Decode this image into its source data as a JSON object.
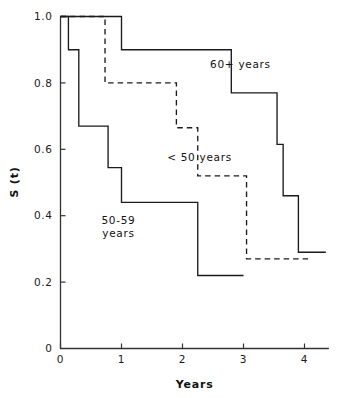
{
  "chart_data": {
    "type": "line",
    "subtype": "kaplan-meier-step",
    "title": "",
    "xlabel": "Years",
    "ylabel": "S (t)",
    "xlim": [
      0,
      4.4
    ],
    "ylim": [
      0,
      1.0
    ],
    "xticks": [
      0,
      1,
      2,
      3,
      4
    ],
    "xtick_labels": [
      "0",
      "1",
      "2",
      "3",
      "4"
    ],
    "yticks": [
      0,
      0.2,
      0.4,
      0.6,
      0.8,
      1.0
    ],
    "ytick_labels": [
      "0",
      "0.2",
      "0.4",
      "0.6",
      "0.8",
      "1.0"
    ],
    "grid": false,
    "legend": "inline-annotations",
    "series": [
      {
        "name": "60+ years",
        "style": "solid",
        "label_x": 2.95,
        "label_y": 0.845,
        "x": [
          0.0,
          1.0,
          1.0,
          2.8,
          2.8,
          3.55,
          3.55,
          3.65,
          3.65,
          3.9,
          3.9,
          4.35
        ],
        "y": [
          1.0,
          1.0,
          0.9,
          0.9,
          0.77,
          0.77,
          0.615,
          0.615,
          0.46,
          0.46,
          0.29,
          0.29
        ],
        "steps": [
          {
            "t": 0.0,
            "s": 1.0
          },
          {
            "t": 1.0,
            "s": 0.9
          },
          {
            "t": 2.8,
            "s": 0.77
          },
          {
            "t": 3.55,
            "s": 0.615
          },
          {
            "t": 3.65,
            "s": 0.46
          },
          {
            "t": 3.9,
            "s": 0.29
          }
        ],
        "end_time": 4.35
      },
      {
        "name": "< 50 years",
        "style": "dashed",
        "label_x": 2.28,
        "label_y": 0.565,
        "x": [
          0.0,
          0.73,
          0.73,
          1.9,
          1.9,
          2.25,
          2.25,
          3.05,
          3.05,
          4.1
        ],
        "y": [
          1.0,
          1.0,
          0.8,
          0.8,
          0.665,
          0.665,
          0.52,
          0.52,
          0.27,
          0.27
        ],
        "steps": [
          {
            "t": 0.0,
            "s": 1.0
          },
          {
            "t": 0.73,
            "s": 0.8
          },
          {
            "t": 1.9,
            "s": 0.665
          },
          {
            "t": 2.25,
            "s": 0.52
          },
          {
            "t": 3.05,
            "s": 0.27
          }
        ],
        "end_time": 4.1
      },
      {
        "name": "50-59\nyears",
        "label_line1": "50-59",
        "label_line2": "years",
        "style": "solid",
        "label_x": 0.95,
        "label_y": 0.375,
        "x": [
          0.0,
          0.13,
          0.13,
          0.3,
          0.3,
          0.78,
          0.78,
          1.0,
          1.0,
          2.25,
          2.25,
          3.0
        ],
        "y": [
          1.0,
          1.0,
          0.9,
          0.9,
          0.67,
          0.67,
          0.545,
          0.545,
          0.44,
          0.44,
          0.22,
          0.22
        ],
        "steps": [
          {
            "t": 0.0,
            "s": 1.0
          },
          {
            "t": 0.13,
            "s": 0.9
          },
          {
            "t": 0.3,
            "s": 0.67
          },
          {
            "t": 0.78,
            "s": 0.545
          },
          {
            "t": 1.0,
            "s": 0.44
          },
          {
            "t": 2.25,
            "s": 0.22
          }
        ],
        "end_time": 3.0
      }
    ],
    "colors": {
      "axis": "#333333",
      "curve": "#1b1b1b",
      "background": "#ffffff"
    }
  }
}
